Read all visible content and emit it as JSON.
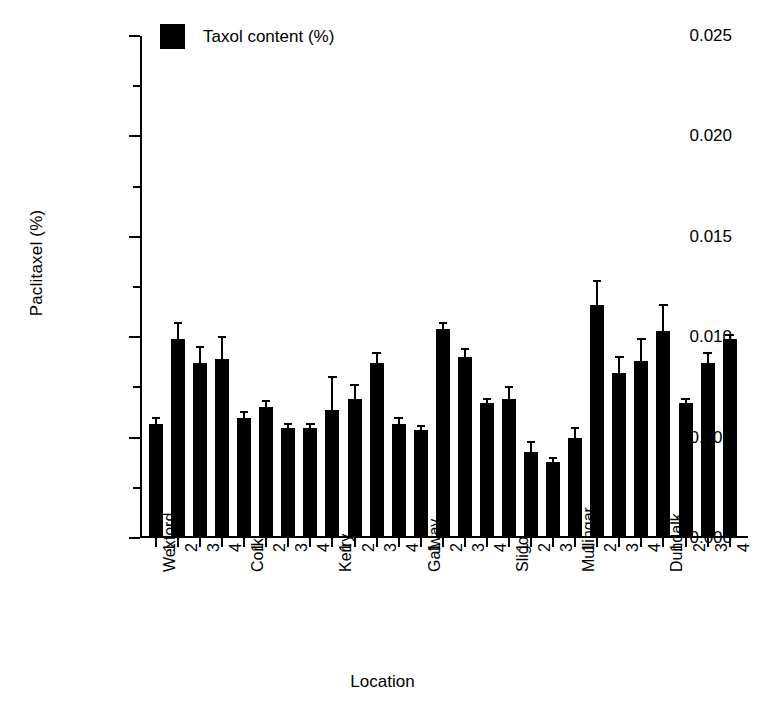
{
  "chart_data": {
    "type": "bar",
    "title": "",
    "xlabel": "Location",
    "ylabel": "Paclitaxel (%)",
    "ylim": [
      0.0,
      0.025
    ],
    "ytick_labels": [
      "0.000",
      "0.005",
      "0.010",
      "0.015",
      "0.020",
      "0.025"
    ],
    "ytick_values": [
      0.0,
      0.005,
      0.01,
      0.015,
      0.02,
      0.025
    ],
    "yminor_values": [
      0.0025,
      0.0075,
      0.0125,
      0.0175,
      0.0225
    ],
    "grid": false,
    "legend": {
      "position": "top-left-inside",
      "entries": [
        {
          "label": "Taxol content (%)",
          "color": "#000000",
          "marker": "filled-square"
        }
      ]
    },
    "bar_color": "#000000",
    "errorbar_color": "#000000",
    "categories": [
      "Wexford 1",
      "Wexford 2",
      "Wexford 3",
      "Wexford 4",
      "Cork 1",
      "Cork 2",
      "Cork 3",
      "Cork 4",
      "Kerry 1",
      "Kerry 2",
      "Kerry 3",
      "Kerry 4",
      "Galway 1",
      "Galway 2",
      "Galway 3",
      "Galway 4",
      "Sligo 1",
      "Sligo 2",
      "Sligo 3",
      "Mullingar 1",
      "Mullingar 2",
      "Mullingar 3",
      "Mullingar 4",
      "Dundalk 1",
      "Dundalk 2",
      "Dundalk 3",
      "Dundalk 4"
    ],
    "location_groups": [
      {
        "name": "Wexford",
        "replicates": [
          "1",
          "2",
          "3",
          "4"
        ]
      },
      {
        "name": "Cork",
        "replicates": [
          "1",
          "2",
          "3",
          "4"
        ]
      },
      {
        "name": "Kerry",
        "replicates": [
          "1",
          "2",
          "3",
          "4"
        ]
      },
      {
        "name": "Galway",
        "replicates": [
          "1",
          "2",
          "3",
          "4"
        ]
      },
      {
        "name": "Sligo",
        "replicates": [
          "1",
          "2",
          "3"
        ]
      },
      {
        "name": "Mullingar",
        "replicates": [
          "1",
          "2",
          "3",
          "4"
        ]
      },
      {
        "name": "Dundalk",
        "replicates": [
          "1",
          "2",
          "3",
          "4"
        ]
      }
    ],
    "series": [
      {
        "name": "Taxol content (%)",
        "values": [
          0.0057,
          0.0099,
          0.0087,
          0.0089,
          0.006,
          0.0065,
          0.0055,
          0.0055,
          0.0064,
          0.0069,
          0.0087,
          0.0057,
          0.0054,
          0.0104,
          0.009,
          0.0067,
          0.0069,
          0.0043,
          0.0038,
          0.005,
          0.0116,
          0.0082,
          0.0088,
          0.0103,
          0.0067,
          0.0087,
          0.0099
        ],
        "errors": [
          0.0003,
          0.0008,
          0.0008,
          0.0011,
          0.0003,
          0.0003,
          0.0002,
          0.0002,
          0.0016,
          0.0007,
          0.0005,
          0.0003,
          0.0002,
          0.0003,
          0.0004,
          0.0002,
          0.0006,
          0.0005,
          0.0002,
          0.0005,
          0.0012,
          0.0008,
          0.0011,
          0.0013,
          0.0002,
          0.0005,
          0.0002
        ]
      }
    ]
  }
}
